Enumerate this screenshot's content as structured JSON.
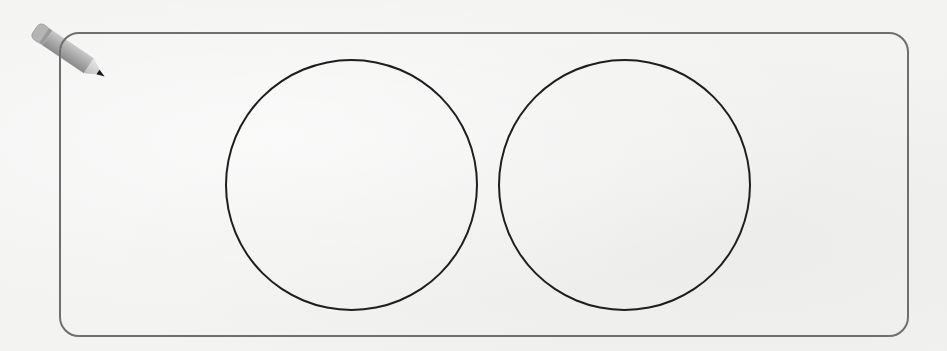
{
  "worksheet": {
    "icon": "pencil-icon",
    "answer_area": {
      "shape": "rounded-rectangle",
      "border_color": "#6f6f6f"
    },
    "circles": [
      {
        "id": "left",
        "content": "",
        "stroke": "#1e1e1e"
      },
      {
        "id": "right",
        "content": "",
        "stroke": "#1e1e1e"
      }
    ]
  }
}
